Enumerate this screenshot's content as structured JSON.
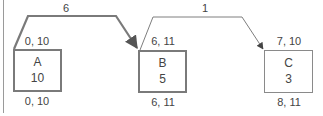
{
  "diagram": {
    "type": "network-diagram",
    "colors": {
      "background": "#ffffff",
      "strong_line": "#7a7a7a",
      "light_line": "#8a8a8a",
      "text": "#444444",
      "frame_line": "#9a9a9a"
    },
    "nodes": [
      {
        "id": "A",
        "label": "A",
        "duration": "10",
        "top_label": "0, 10",
        "bottom_label": "0, 10",
        "emphasis": "critical"
      },
      {
        "id": "B",
        "label": "B",
        "duration": "5",
        "top_label": "6, 11",
        "bottom_label": "6, 11",
        "emphasis": "critical"
      },
      {
        "id": "C",
        "label": "C",
        "duration": "3",
        "top_label": "7, 10",
        "bottom_label": "8, 11",
        "emphasis": "normal"
      }
    ],
    "edges": [
      {
        "from": "A",
        "to": "B",
        "label": "6",
        "emphasis": "critical"
      },
      {
        "from": "B",
        "to": "C",
        "label": "1",
        "emphasis": "normal"
      }
    ]
  }
}
